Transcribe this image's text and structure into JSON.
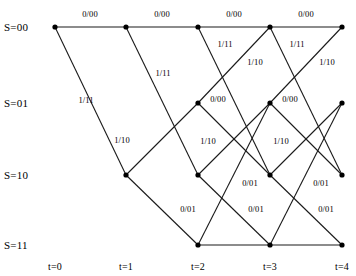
{
  "figure": {
    "kind": "trellis-diagram",
    "width": 356,
    "height": 276,
    "background_color": "#ffffff",
    "line_color": "#1a1a1a",
    "node_color": "#000000",
    "text_color": "#000000"
  },
  "states": [
    {
      "id": "s00",
      "label": "S=00",
      "y": 27
    },
    {
      "id": "s01",
      "label": "S=01",
      "y": 103
    },
    {
      "id": "s10",
      "label": "S=10",
      "y": 175
    },
    {
      "id": "s11",
      "label": "S=11",
      "y": 245
    }
  ],
  "times": [
    {
      "id": "t0",
      "label": "t=0",
      "x": 55
    },
    {
      "id": "t1",
      "label": "t=1",
      "x": 126
    },
    {
      "id": "t2",
      "label": "t=2",
      "x": 198
    },
    {
      "id": "t3",
      "label": "t=3",
      "x": 270
    },
    {
      "id": "t4",
      "label": "t=4",
      "x": 342
    }
  ],
  "time_label_y": 261,
  "state_label_x": 4,
  "nodes": [
    {
      "id": "n_t0_s00",
      "t": 0,
      "state": "s00",
      "x": 55,
      "y": 27
    },
    {
      "id": "n_t1_s00",
      "t": 1,
      "state": "s00",
      "x": 126,
      "y": 27
    },
    {
      "id": "n_t1_s10",
      "t": 1,
      "state": "s10",
      "x": 126,
      "y": 175
    },
    {
      "id": "n_t2_s00",
      "t": 2,
      "state": "s00",
      "x": 198,
      "y": 27
    },
    {
      "id": "n_t2_s01",
      "t": 2,
      "state": "s01",
      "x": 198,
      "y": 103
    },
    {
      "id": "n_t2_s10",
      "t": 2,
      "state": "s10",
      "x": 198,
      "y": 175
    },
    {
      "id": "n_t2_s11",
      "t": 2,
      "state": "s11",
      "x": 198,
      "y": 245
    },
    {
      "id": "n_t3_s00",
      "t": 3,
      "state": "s00",
      "x": 270,
      "y": 27
    },
    {
      "id": "n_t3_s01",
      "t": 3,
      "state": "s01",
      "x": 270,
      "y": 103
    },
    {
      "id": "n_t3_s10",
      "t": 3,
      "state": "s10",
      "x": 270,
      "y": 175
    },
    {
      "id": "n_t3_s11",
      "t": 3,
      "state": "s11",
      "x": 270,
      "y": 245
    },
    {
      "id": "n_t4_s00",
      "t": 4,
      "state": "s00",
      "x": 342,
      "y": 27
    },
    {
      "id": "n_t4_s01",
      "t": 4,
      "state": "s01",
      "x": 342,
      "y": 103
    },
    {
      "id": "n_t4_s10",
      "t": 4,
      "state": "s10",
      "x": 342,
      "y": 175
    },
    {
      "id": "n_t4_s11",
      "t": 4,
      "state": "s11",
      "x": 342,
      "y": 245
    }
  ],
  "edges": [
    {
      "id": "e1",
      "from": "n_t0_s00",
      "to": "n_t1_s00",
      "input": "0",
      "output": "00"
    },
    {
      "id": "e2",
      "from": "n_t0_s00",
      "to": "n_t1_s10",
      "input": "1",
      "output": "11"
    },
    {
      "id": "e3",
      "from": "n_t1_s00",
      "to": "n_t2_s00",
      "input": "0",
      "output": "00"
    },
    {
      "id": "e4",
      "from": "n_t1_s00",
      "to": "n_t2_s10",
      "input": "1",
      "output": "11"
    },
    {
      "id": "e5",
      "from": "n_t1_s10",
      "to": "n_t2_s01",
      "input": "0",
      "output": "01"
    },
    {
      "id": "e6",
      "from": "n_t1_s10",
      "to": "n_t2_s11",
      "input": "1",
      "output": "10"
    },
    {
      "id": "e7",
      "from": "n_t2_s00",
      "to": "n_t3_s00",
      "input": "0",
      "output": "00"
    },
    {
      "id": "e8",
      "from": "n_t2_s00",
      "to": "n_t3_s10",
      "input": "1",
      "output": "11"
    },
    {
      "id": "e9",
      "from": "n_t2_s01",
      "to": "n_t3_s00",
      "input": "0",
      "output": "00"
    },
    {
      "id": "e10",
      "from": "n_t2_s01",
      "to": "n_t3_s10",
      "input": "1",
      "output": "10"
    },
    {
      "id": "e11",
      "from": "n_t2_s10",
      "to": "n_t3_s01",
      "input": "0",
      "output": "01"
    },
    {
      "id": "e12",
      "from": "n_t2_s10",
      "to": "n_t3_s11",
      "input": "1",
      "output": "10"
    },
    {
      "id": "e13",
      "from": "n_t2_s11",
      "to": "n_t3_s01",
      "input": "0",
      "output": "01"
    },
    {
      "id": "e14",
      "from": "n_t2_s11",
      "to": "n_t3_s11",
      "input": "1",
      "output": "10"
    },
    {
      "id": "e15",
      "from": "n_t3_s00",
      "to": "n_t4_s00",
      "input": "0",
      "output": "00"
    },
    {
      "id": "e16",
      "from": "n_t3_s00",
      "to": "n_t4_s10",
      "input": "1",
      "output": "11"
    },
    {
      "id": "e17",
      "from": "n_t3_s01",
      "to": "n_t4_s00",
      "input": "0",
      "output": "00"
    },
    {
      "id": "e18",
      "from": "n_t3_s01",
      "to": "n_t4_s10",
      "input": "1",
      "output": "10"
    },
    {
      "id": "e19",
      "from": "n_t3_s10",
      "to": "n_t4_s01",
      "input": "0",
      "output": "01"
    },
    {
      "id": "e20",
      "from": "n_t3_s10",
      "to": "n_t4_s11",
      "input": "1",
      "output": "10"
    },
    {
      "id": "e21",
      "from": "n_t3_s11",
      "to": "n_t4_s01",
      "input": "0",
      "output": "01"
    },
    {
      "id": "e22",
      "from": "n_t3_s11",
      "to": "n_t4_s11",
      "input": "1",
      "output": "10"
    }
  ],
  "edge_labels": [
    {
      "id": "l1",
      "text": "0/00",
      "x": 90,
      "y": 14
    },
    {
      "id": "l2",
      "text": "0/00",
      "x": 162,
      "y": 14
    },
    {
      "id": "l3",
      "text": "0/00",
      "x": 234,
      "y": 14
    },
    {
      "id": "l4",
      "text": "0/00",
      "x": 306,
      "y": 14
    },
    {
      "id": "l5",
      "text": "1/11",
      "x": 86,
      "y": 100
    },
    {
      "id": "l6",
      "text": "1/11",
      "x": 163,
      "y": 73
    },
    {
      "id": "l7",
      "text": "1/11",
      "x": 225,
      "y": 44
    },
    {
      "id": "l8",
      "text": "1/11",
      "x": 297,
      "y": 44
    },
    {
      "id": "l9",
      "text": "1/10",
      "x": 255,
      "y": 62
    },
    {
      "id": "l10",
      "text": "1/10",
      "x": 327,
      "y": 62
    },
    {
      "id": "l11",
      "text": "1/10",
      "x": 122,
      "y": 140
    },
    {
      "id": "l12",
      "text": "0/00",
      "x": 218,
      "y": 99
    },
    {
      "id": "l13",
      "text": "0/00",
      "x": 290,
      "y": 99
    },
    {
      "id": "l14",
      "text": "1/10",
      "x": 208,
      "y": 141
    },
    {
      "id": "l15",
      "text": "1/10",
      "x": 281,
      "y": 141
    },
    {
      "id": "l16",
      "text": "0/01",
      "x": 250,
      "y": 183
    },
    {
      "id": "l17",
      "text": "0/01",
      "x": 321,
      "y": 183
    },
    {
      "id": "l18",
      "text": "0/01",
      "x": 188,
      "y": 209
    },
    {
      "id": "l19",
      "text": "0/01",
      "x": 256,
      "y": 209
    },
    {
      "id": "l20",
      "text": "0/01",
      "x": 326,
      "y": 209
    }
  ]
}
